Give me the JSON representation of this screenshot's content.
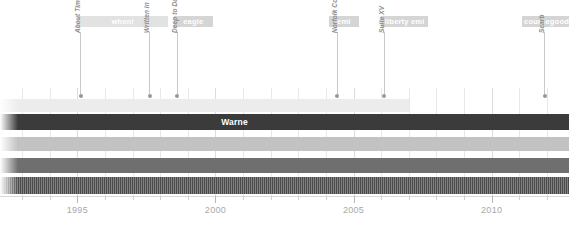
{
  "chart_data": {
    "type": "timeline",
    "title": "",
    "xlabel": "",
    "ylabel": "",
    "xlim": [
      1992.2,
      2012.8
    ],
    "grid": true,
    "axis_ticks": [
      {
        "label": "1995",
        "value": 1995
      },
      {
        "label": "2000",
        "value": 2000
      },
      {
        "label": "2005",
        "value": 2005
      },
      {
        "label": "2010",
        "value": 2010
      }
    ],
    "minor_tick_values": [
      1993,
      1994,
      1996,
      1997,
      1998,
      1999,
      2001,
      2002,
      2003,
      2004,
      2006,
      2007,
      2008,
      2009,
      2011,
      2012
    ],
    "eras": [
      {
        "label": "when!",
        "start": 1995.0,
        "end": 1998.3,
        "shade": "light"
      },
      {
        "label": "eagle",
        "start": 1998.5,
        "end": 1999.9,
        "shade": "dark"
      },
      {
        "label": "emi",
        "start": 2004.1,
        "end": 2005.2,
        "shade": "dark"
      },
      {
        "label": "liberty emi",
        "start": 2006.0,
        "end": 2007.7,
        "shade": "dark"
      },
      {
        "label": "coursegood",
        "start": 2011.1,
        "end": 2012.8,
        "shade": "dark"
      }
    ],
    "releases": [
      {
        "title": "About Time",
        "value": 1995.1
      },
      {
        "title": "Written in Red",
        "value": 1997.6
      },
      {
        "title": "Deep to Dance",
        "value": 1998.6
      },
      {
        "title": "Norfolk Coast",
        "value": 2004.4
      },
      {
        "title": "Suite XV",
        "value": 2006.1
      },
      {
        "title": "Scarb",
        "value": 2011.9
      }
    ],
    "members": [
      {
        "name": "",
        "start": 1992.2,
        "end": 2007.0,
        "color": "#ececec",
        "texture": "solid",
        "label_visible": false
      },
      {
        "name": "Warne",
        "start": 1992.2,
        "end": 2012.8,
        "color": "#3b3b3b",
        "texture": "solid",
        "label_visible": true,
        "label_at": 2000.1
      },
      {
        "name": "",
        "start": 1992.2,
        "end": 2012.8,
        "color": "#c2c2c2",
        "texture": "solid",
        "label_visible": false
      },
      {
        "name": "",
        "start": 1992.2,
        "end": 2012.8,
        "color": "#6f6f6f",
        "texture": "solid",
        "label_visible": false
      },
      {
        "name": "",
        "start": 1992.2,
        "end": 2012.8,
        "color": "#4a4a4a",
        "texture": "hatched",
        "label_visible": false
      }
    ],
    "colors": {
      "era_badge_light": "#e2e2e2",
      "era_badge_dark": "#d5d5d5",
      "grid": "#e8e8e8",
      "axis_text": "#a8a8a8",
      "release_text": "#8d8d8d"
    }
  }
}
